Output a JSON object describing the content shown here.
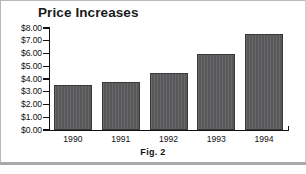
{
  "figure": {
    "caption": "Fig.  2",
    "border_color": "#b8b8b8",
    "rule_color": "#a9a9a9"
  },
  "chart_data": {
    "type": "bar",
    "title": "Price Increases",
    "xlabel": "",
    "ylabel": "",
    "categories": [
      "1990",
      "1991",
      "1992",
      "1993",
      "1994"
    ],
    "values": [
      3.5,
      3.75,
      4.5,
      6.0,
      7.5
    ],
    "ylim": [
      0,
      8
    ],
    "ytick_labels": [
      "$8.00",
      "$7.00",
      "$6.00",
      "$5.00",
      "$4.00",
      "$3.00",
      "$2.00",
      "$1.00",
      "$0.00"
    ],
    "ytick_values": [
      8,
      7,
      6,
      5,
      4,
      3,
      2,
      1,
      0
    ],
    "grid": false,
    "legend": false,
    "bar_color": "#58585a",
    "bar_edge_color": "#3a3a3c",
    "axis_color": "#111111",
    "background": "#ffffff"
  }
}
